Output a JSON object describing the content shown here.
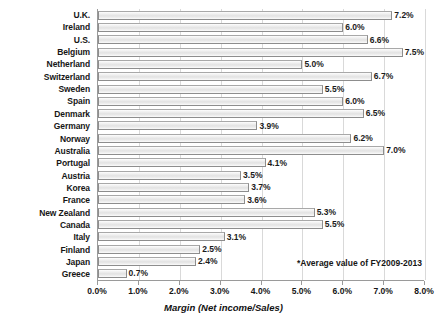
{
  "chart_data": {
    "type": "bar",
    "orientation": "horizontal",
    "title": "",
    "xlabel": "Margin (Net income/Sales)",
    "ylabel": "",
    "xlim": [
      0,
      8
    ],
    "xtick_labels": [
      "0.0%",
      "1.0%",
      "2.0%",
      "3.0%",
      "4.0%",
      "5.0%",
      "6.0%",
      "7.0%",
      "8.0%"
    ],
    "xtick_values": [
      0,
      1,
      2,
      3,
      4,
      5,
      6,
      7,
      8
    ],
    "grid": true,
    "legend": false,
    "value_suffix": "%",
    "categories": [
      "U.K.",
      "Ireland",
      "U.S.",
      "Belgium",
      "Netherland",
      "Switzerland",
      "Sweden",
      "Spain",
      "Denmark",
      "Germany",
      "Norway",
      "Australia",
      "Portugal",
      "Austria",
      "Korea",
      "France",
      "New Zealand",
      "Canada",
      "Italy",
      "Finland",
      "Japan",
      "Greece"
    ],
    "values": [
      7.2,
      6.0,
      6.6,
      7.5,
      5.0,
      6.7,
      5.5,
      6.0,
      6.5,
      3.9,
      6.2,
      7.0,
      4.1,
      3.5,
      3.7,
      3.6,
      5.3,
      5.5,
      3.1,
      2.5,
      2.4,
      0.7
    ],
    "data_labels": [
      "7.2%",
      "6.0%",
      "6.6%",
      "7.5%",
      "5.0%",
      "6.7%",
      "5.5%",
      "6.0%",
      "6.5%",
      "3.9%",
      "6.2%",
      "7.0%",
      "4.1%",
      "3.5%",
      "3.7%",
      "3.6%",
      "5.3%",
      "5.5%",
      "3.1%",
      "2.5%",
      "2.4%",
      "0.7%"
    ],
    "annotations": [
      "*Average value of FY2009-2013"
    ],
    "colors": {
      "bar_fill": "#ebebeb",
      "bar_border": "#8d8d8d",
      "gridline": "#d9d9d9",
      "axis": "#9a9a9a",
      "text": "#161616"
    }
  },
  "footnote": "*Average value of FY2009-2013",
  "axis": {
    "x_title": "Margin (Net income/Sales)"
  }
}
